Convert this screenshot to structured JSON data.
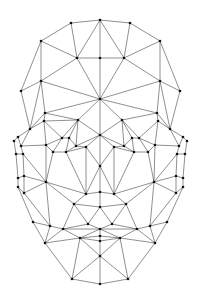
{
  "diagram": {
    "type": "face-mesh-triangulation",
    "colors": {
      "background": "#ffffff",
      "edge": "#333333",
      "vertex": "#111111"
    },
    "vertex_radius": 1.3,
    "vertices": [
      [
        100,
        20
      ],
      [
        71,
        23
      ],
      [
        130,
        23
      ],
      [
        41,
        41
      ],
      [
        160,
        41
      ],
      [
        77,
        58
      ],
      [
        100,
        58
      ],
      [
        124,
        58
      ],
      [
        41,
        81
      ],
      [
        160,
        81
      ],
      [
        21,
        91
      ],
      [
        180,
        91
      ],
      [
        100,
        99
      ],
      [
        45,
        113
      ],
      [
        78,
        120
      ],
      [
        44,
        121
      ],
      [
        122,
        120
      ],
      [
        157,
        113
      ],
      [
        158,
        121
      ],
      [
        30,
        129
      ],
      [
        170,
        129
      ],
      [
        18,
        137
      ],
      [
        14,
        141
      ],
      [
        183,
        137
      ],
      [
        187,
        141
      ],
      [
        100,
        135
      ],
      [
        62,
        138
      ],
      [
        69,
        138
      ],
      [
        132,
        138
      ],
      [
        139,
        138
      ],
      [
        21,
        146
      ],
      [
        46,
        145
      ],
      [
        76,
        146
      ],
      [
        124,
        146
      ],
      [
        155,
        145
      ],
      [
        179,
        146
      ],
      [
        53,
        152
      ],
      [
        66,
        152
      ],
      [
        134,
        152
      ],
      [
        148,
        152
      ],
      [
        16,
        154
      ],
      [
        23,
        154
      ],
      [
        177,
        154
      ],
      [
        185,
        154
      ],
      [
        86,
        147
      ],
      [
        114,
        147
      ],
      [
        100,
        166
      ],
      [
        18,
        178
      ],
      [
        24,
        176
      ],
      [
        176,
        176
      ],
      [
        183,
        178
      ],
      [
        46,
        182
      ],
      [
        154,
        182
      ],
      [
        86,
        194
      ],
      [
        100,
        192
      ],
      [
        114,
        194
      ],
      [
        18,
        187
      ],
      [
        24,
        193
      ],
      [
        176,
        193
      ],
      [
        183,
        187
      ],
      [
        74,
        204
      ],
      [
        100,
        207
      ],
      [
        126,
        204
      ],
      [
        33,
        222
      ],
      [
        50,
        226
      ],
      [
        150,
        226
      ],
      [
        167,
        222
      ],
      [
        88,
        224
      ],
      [
        112,
        224
      ],
      [
        63,
        229
      ],
      [
        100,
        229
      ],
      [
        137,
        229
      ],
      [
        45,
        243
      ],
      [
        80,
        238
      ],
      [
        100,
        236
      ],
      [
        120,
        238
      ],
      [
        155,
        243
      ],
      [
        100,
        241
      ],
      [
        100,
        256
      ],
      [
        72,
        279
      ],
      [
        100,
        284
      ],
      [
        128,
        279
      ]
    ],
    "edges": [
      [
        0,
        1
      ],
      [
        0,
        2
      ],
      [
        1,
        3
      ],
      [
        2,
        4
      ],
      [
        0,
        6
      ],
      [
        0,
        5
      ],
      [
        0,
        7
      ],
      [
        1,
        5
      ],
      [
        2,
        7
      ],
      [
        5,
        6
      ],
      [
        6,
        7
      ],
      [
        3,
        5
      ],
      [
        4,
        7
      ],
      [
        3,
        8
      ],
      [
        4,
        9
      ],
      [
        5,
        8
      ],
      [
        7,
        9
      ],
      [
        6,
        12
      ],
      [
        5,
        12
      ],
      [
        7,
        12
      ],
      [
        8,
        10
      ],
      [
        9,
        11
      ],
      [
        3,
        10
      ],
      [
        4,
        11
      ],
      [
        8,
        12
      ],
      [
        9,
        12
      ],
      [
        8,
        13
      ],
      [
        9,
        17
      ],
      [
        12,
        13
      ],
      [
        12,
        17
      ],
      [
        12,
        14
      ],
      [
        12,
        16
      ],
      [
        12,
        25
      ],
      [
        10,
        19
      ],
      [
        11,
        20
      ],
      [
        8,
        19
      ],
      [
        9,
        20
      ],
      [
        13,
        19
      ],
      [
        17,
        20
      ],
      [
        13,
        14
      ],
      [
        16,
        17
      ],
      [
        14,
        15
      ],
      [
        17,
        18
      ],
      [
        13,
        15
      ],
      [
        15,
        19
      ],
      [
        18,
        20
      ],
      [
        19,
        21
      ],
      [
        20,
        23
      ],
      [
        21,
        22
      ],
      [
        23,
        24
      ],
      [
        19,
        30
      ],
      [
        20,
        35
      ],
      [
        14,
        26
      ],
      [
        14,
        27
      ],
      [
        14,
        25
      ],
      [
        16,
        25
      ],
      [
        16,
        28
      ],
      [
        16,
        29
      ],
      [
        15,
        26
      ],
      [
        18,
        29
      ],
      [
        26,
        27
      ],
      [
        28,
        29
      ],
      [
        15,
        31
      ],
      [
        18,
        34
      ],
      [
        26,
        31
      ],
      [
        29,
        34
      ],
      [
        27,
        32
      ],
      [
        28,
        33
      ],
      [
        14,
        32
      ],
      [
        16,
        33
      ],
      [
        25,
        32
      ],
      [
        25,
        33
      ],
      [
        31,
        36
      ],
      [
        32,
        37
      ],
      [
        33,
        38
      ],
      [
        34,
        39
      ],
      [
        36,
        37
      ],
      [
        38,
        39
      ],
      [
        26,
        36
      ],
      [
        29,
        39
      ],
      [
        27,
        37
      ],
      [
        28,
        38
      ],
      [
        30,
        31
      ],
      [
        34,
        35
      ],
      [
        22,
        40
      ],
      [
        24,
        43
      ],
      [
        21,
        30
      ],
      [
        23,
        35
      ],
      [
        30,
        41
      ],
      [
        35,
        42
      ],
      [
        40,
        41
      ],
      [
        42,
        43
      ],
      [
        25,
        44
      ],
      [
        25,
        45
      ],
      [
        32,
        44
      ],
      [
        33,
        45
      ],
      [
        44,
        46
      ],
      [
        45,
        46
      ],
      [
        25,
        46
      ],
      [
        37,
        44
      ],
      [
        38,
        45
      ],
      [
        31,
        51
      ],
      [
        34,
        52
      ],
      [
        36,
        51
      ],
      [
        39,
        52
      ],
      [
        37,
        53
      ],
      [
        38,
        55
      ],
      [
        44,
        53
      ],
      [
        45,
        55
      ],
      [
        46,
        53
      ],
      [
        46,
        55
      ],
      [
        46,
        54
      ],
      [
        41,
        48
      ],
      [
        42,
        49
      ],
      [
        40,
        47
      ],
      [
        43,
        50
      ],
      [
        47,
        48
      ],
      [
        49,
        50
      ],
      [
        48,
        51
      ],
      [
        49,
        52
      ],
      [
        41,
        51
      ],
      [
        42,
        52
      ],
      [
        47,
        56
      ],
      [
        50,
        59
      ],
      [
        48,
        57
      ],
      [
        49,
        58
      ],
      [
        56,
        57
      ],
      [
        58,
        59
      ],
      [
        57,
        51
      ],
      [
        58,
        52
      ],
      [
        56,
        63
      ],
      [
        59,
        66
      ],
      [
        51,
        53
      ],
      [
        52,
        55
      ],
      [
        53,
        54
      ],
      [
        54,
        55
      ],
      [
        53,
        60
      ],
      [
        55,
        62
      ],
      [
        54,
        61
      ],
      [
        60,
        61
      ],
      [
        61,
        62
      ],
      [
        51,
        64
      ],
      [
        52,
        65
      ],
      [
        51,
        60
      ],
      [
        52,
        62
      ],
      [
        57,
        64
      ],
      [
        58,
        65
      ],
      [
        63,
        64
      ],
      [
        65,
        66
      ],
      [
        60,
        67
      ],
      [
        62,
        68
      ],
      [
        61,
        67
      ],
      [
        61,
        68
      ],
      [
        60,
        69
      ],
      [
        62,
        71
      ],
      [
        67,
        69
      ],
      [
        68,
        71
      ],
      [
        67,
        70
      ],
      [
        68,
        70
      ],
      [
        69,
        70
      ],
      [
        70,
        71
      ],
      [
        64,
        69
      ],
      [
        65,
        71
      ],
      [
        63,
        72
      ],
      [
        66,
        76
      ],
      [
        64,
        72
      ],
      [
        65,
        76
      ],
      [
        69,
        73
      ],
      [
        71,
        75
      ],
      [
        70,
        74
      ],
      [
        73,
        74
      ],
      [
        74,
        75
      ],
      [
        73,
        77
      ],
      [
        75,
        77
      ],
      [
        74,
        77
      ],
      [
        70,
        73
      ],
      [
        70,
        75
      ],
      [
        72,
        73
      ],
      [
        75,
        76
      ],
      [
        72,
        79
      ],
      [
        76,
        81
      ],
      [
        73,
        79
      ],
      [
        75,
        81
      ],
      [
        77,
        78
      ],
      [
        73,
        78
      ],
      [
        75,
        78
      ],
      [
        78,
        79
      ],
      [
        78,
        81
      ],
      [
        79,
        80
      ],
      [
        80,
        81
      ],
      [
        78,
        80
      ],
      [
        69,
        72
      ],
      [
        71,
        76
      ]
    ]
  }
}
